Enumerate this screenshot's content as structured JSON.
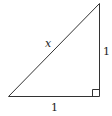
{
  "diagram": {
    "type": "right-triangle",
    "labels": {
      "hypotenuse": "x",
      "vertical_leg": "1",
      "horizontal_leg": "1"
    },
    "right_angle_marker": true,
    "colors": {
      "stroke": "#333333",
      "background": "#ffffff"
    }
  }
}
